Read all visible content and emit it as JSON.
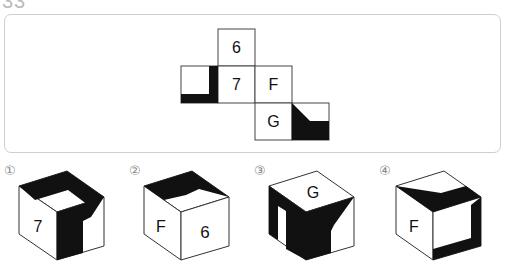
{
  "question": {
    "number": "33",
    "net": {
      "faces": [
        {
          "id": "top",
          "label": "6"
        },
        {
          "id": "left",
          "label": "",
          "pattern": "L-shaped black band on right and bottom edges"
        },
        {
          "id": "center",
          "label": "7"
        },
        {
          "id": "right",
          "label": "F"
        },
        {
          "id": "bottom",
          "label": "G"
        },
        {
          "id": "bottom-right",
          "label": "",
          "pattern": "black trapezoid with diagonal from top-left"
        }
      ]
    },
    "options": [
      {
        "marker": "①",
        "front": "7"
      },
      {
        "marker": "②",
        "front": "F",
        "right": "6"
      },
      {
        "marker": "③",
        "top": "G"
      },
      {
        "marker": "④",
        "front": "F"
      }
    ]
  },
  "colors": {
    "ink": "#111111",
    "frame": "#cfcfcf",
    "marker": "#888888"
  }
}
